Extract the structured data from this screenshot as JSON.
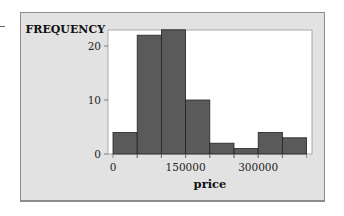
{
  "chart_data": {
    "type": "bar",
    "subtype": "histogram",
    "title": "",
    "xlabel": "price",
    "ylabel": "FREQUENCY",
    "bin_width": 50000,
    "bins": [
      {
        "start": 0,
        "end": 50000,
        "count": 4
      },
      {
        "start": 50000,
        "end": 100000,
        "count": 22
      },
      {
        "start": 100000,
        "end": 150000,
        "count": 23
      },
      {
        "start": 150000,
        "end": 200000,
        "count": 10
      },
      {
        "start": 200000,
        "end": 250000,
        "count": 2
      },
      {
        "start": 250000,
        "end": 300000,
        "count": 1
      },
      {
        "start": 300000,
        "end": 350000,
        "count": 4
      },
      {
        "start": 350000,
        "end": 400000,
        "count": 3
      }
    ],
    "categories": [
      "0-50000",
      "50000-100000",
      "100000-150000",
      "150000-200000",
      "200000-250000",
      "250000-300000",
      "300000-350000",
      "350000-400000"
    ],
    "values": [
      4,
      22,
      23,
      10,
      2,
      1,
      4,
      3
    ],
    "x_ticks": [
      0,
      150000,
      300000
    ],
    "x_tick_labels": [
      "0",
      "150000",
      "300000"
    ],
    "y_ticks": [
      0,
      10,
      20
    ],
    "y_tick_labels": [
      "0",
      "10",
      "20"
    ],
    "xlim": [
      0,
      400000
    ],
    "ylim": [
      0,
      23
    ],
    "grid": false,
    "legend": null,
    "colors": {
      "bar": "#5a5a5a",
      "bar_edge": "#222222",
      "panel": "#e2e2e2",
      "plot_bg": "#ffffff"
    }
  }
}
